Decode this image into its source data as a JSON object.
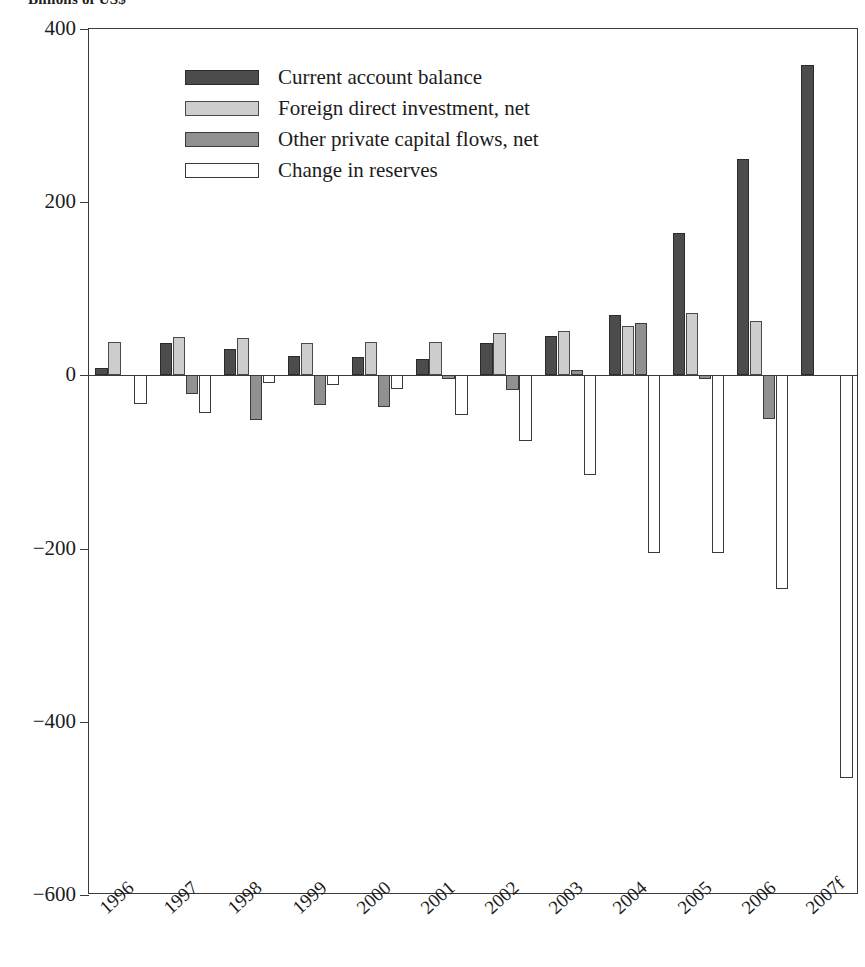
{
  "figure": {
    "units_caption": "Billions of US$",
    "legend_position": "top-left-inside"
  },
  "legend": {
    "items": [
      {
        "label": "Current account balance",
        "color": "#4c4c4c",
        "swatch": "dark-gray-swatch"
      },
      {
        "label": "Foreign direct investment, net",
        "color": "#cdcdcd",
        "swatch": "light-gray-swatch"
      },
      {
        "label": "Other private capital flows, net",
        "color": "#919191",
        "swatch": "medium-gray-swatch"
      },
      {
        "label": "Change in reserves",
        "color": "#ffffff",
        "swatch": "white-swatch"
      }
    ]
  },
  "axes": {
    "y_ticks": [
      400,
      200,
      0,
      -200,
      -400,
      -600
    ],
    "y_tick_labels": [
      "400",
      "200",
      "0",
      "−200",
      "−400",
      "−600"
    ],
    "x_tick_labels": [
      "1996",
      "1997",
      "1998",
      "1999",
      "2000",
      "2001",
      "2002",
      "2003",
      "2004",
      "2005",
      "2006",
      "2007f"
    ]
  },
  "chart_data": {
    "type": "bar",
    "title": "",
    "subtitle": "",
    "xlabel": "",
    "ylabel": "Billions of US$",
    "ylim": [
      -600,
      400
    ],
    "ytick_step": 200,
    "grid": false,
    "legend_position": "upper left (inside plot)",
    "categories": [
      "1996",
      "1997",
      "1998",
      "1999",
      "2000",
      "2001",
      "2002",
      "2003",
      "2004",
      "2005",
      "2006",
      "2007f"
    ],
    "series": [
      {
        "name": "Current account balance",
        "color": "#4c4c4c",
        "values": [
          8,
          37,
          31,
          22,
          21,
          19,
          37,
          46,
          70,
          164,
          250,
          358
        ]
      },
      {
        "name": "Foreign direct investment, net",
        "color": "#cdcdcd",
        "values": [
          39,
          44,
          43,
          37,
          39,
          39,
          49,
          51,
          57,
          72,
          63,
          0
        ]
      },
      {
        "name": "Other private capital flows, net",
        "color": "#919191",
        "values": [
          0,
          -21,
          -51,
          -34,
          -37,
          -4,
          -17,
          6,
          60,
          -4,
          -50,
          0
        ]
      },
      {
        "name": "Change in reserves",
        "color": "#ffffff",
        "values": [
          -33,
          -44,
          -9,
          -11,
          -16,
          -46,
          -76,
          -115,
          -205,
          -205,
          -247,
          -465
        ]
      }
    ]
  }
}
